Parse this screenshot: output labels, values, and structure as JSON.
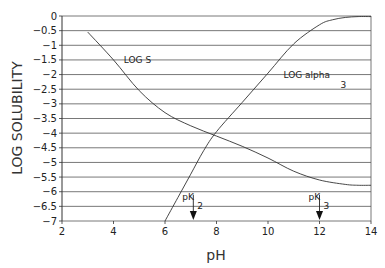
{
  "chart_data": {
    "type": "line",
    "title": "",
    "xlabel": "pH",
    "ylabel": "LOG SOLUBILITY",
    "xlim": [
      2,
      14
    ],
    "ylim": [
      -7,
      0
    ],
    "xticks": [
      "2",
      "4",
      "6",
      "8",
      "10",
      "12",
      "14"
    ],
    "yticks": [
      "0",
      "-0.5",
      "-1",
      "-1.5",
      "-2",
      "-2.5",
      "-3",
      "-3.5",
      "-4",
      "-4.5",
      "-5",
      "-5.5",
      "-6",
      "-6.5",
      "-7"
    ],
    "grid": "horizontal",
    "series": [
      {
        "name": "LOG S",
        "x": [
          3,
          4,
          5,
          6,
          7,
          8,
          9,
          10,
          11,
          12,
          13,
          13.5,
          14
        ],
        "values": [
          -0.55,
          -1.5,
          -2.55,
          -3.3,
          -3.75,
          -4.1,
          -4.45,
          -4.85,
          -5.3,
          -5.6,
          -5.75,
          -5.78,
          -5.78
        ]
      },
      {
        "name": "LOG alpha 3",
        "x": [
          6,
          6.5,
          7,
          7.5,
          8,
          9,
          10,
          11,
          12,
          12.5,
          13,
          13.5,
          14
        ],
        "values": [
          -7,
          -6.2,
          -5.4,
          -4.6,
          -3.95,
          -2.95,
          -1.95,
          -0.95,
          -0.3,
          -0.13,
          -0.05,
          -0.02,
          -0.02
        ]
      }
    ],
    "annotations": [
      {
        "text": "LOG S",
        "x": 4.4,
        "y": -1.5
      },
      {
        "text": "LOG alpha",
        "sub": "3",
        "x": 10.6,
        "y": -2.0
      },
      {
        "text": "pK",
        "sub": "2",
        "x": 7.1,
        "arrow_to": -7
      },
      {
        "text": "pK",
        "sub": "3",
        "x": 12.0,
        "arrow_to": -7
      }
    ]
  }
}
